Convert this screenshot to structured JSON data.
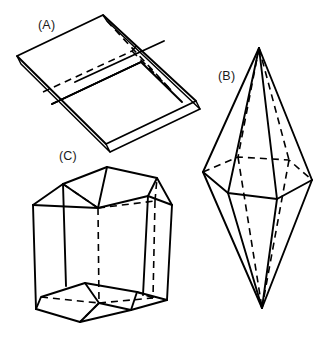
{
  "diagram": {
    "background_color": "#ffffff",
    "line_color": "#000000",
    "width": 333,
    "height": 353,
    "figures": [
      {
        "id": "A",
        "label": "(A)",
        "name": "tabular-platy-crystal",
        "description": "Thin tabular crystal plate drawn in oblique projection with dashed hidden edges",
        "label_x": 38,
        "label_y": 29,
        "outline": [
          [
            103,
            15
          ],
          [
            17,
            56
          ],
          [
            106,
            144
          ],
          [
            196,
            101
          ]
        ],
        "thickness_offset": [
          3,
          7
        ]
      },
      {
        "id": "B",
        "label": "(B)",
        "name": "hexagonal-bipyramid",
        "description": "Hexagonal dipyramid with upper and lower apex and six equatorial vertices",
        "label_x": 218,
        "label_y": 80,
        "apex_top": [
          259,
          48
        ],
        "apex_bottom": [
          262,
          308
        ],
        "equator": [
          [
            203,
            172
          ],
          [
            228,
            193
          ],
          [
            277,
            199
          ],
          [
            312,
            180
          ],
          [
            289,
            160
          ],
          [
            238,
            157
          ]
        ]
      },
      {
        "id": "C",
        "label": "(C)",
        "name": "hexagonal-prism-with-terminations",
        "description": "Hexagonal prism with beveled rhombohedral terminations at top and bottom",
        "label_x": 59,
        "label_y": 160,
        "top_face": [
          [
            63,
            184
          ],
          [
            107,
            167
          ],
          [
            157,
            178
          ],
          [
            148,
            196
          ],
          [
            98,
            208
          ],
          [
            55,
            196
          ]
        ],
        "bottom_face": [
          [
            41,
            297
          ],
          [
            85,
            283
          ],
          [
            137,
            292
          ],
          [
            131,
            310
          ],
          [
            80,
            322
          ],
          [
            36,
            309
          ]
        ]
      }
    ]
  }
}
